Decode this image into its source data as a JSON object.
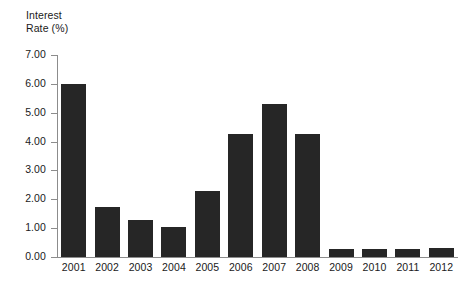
{
  "chart_data": {
    "type": "bar",
    "title": "",
    "ylabel": "Interest\nRate (%)",
    "xlabel": "",
    "categories": [
      "2001",
      "2002",
      "2003",
      "2004",
      "2005",
      "2006",
      "2007",
      "2008",
      "2009",
      "2010",
      "2011",
      "2012"
    ],
    "values": [
      6.0,
      1.75,
      1.3,
      1.05,
      2.28,
      4.25,
      5.3,
      4.25,
      0.28,
      0.28,
      0.28,
      0.3
    ],
    "ylim": [
      0.0,
      7.0
    ],
    "ytick_labels": [
      "7.00",
      "6.00",
      "5.00",
      "4.00",
      "3.00",
      "2.00",
      "1.00",
      "0.00"
    ],
    "ytick_values": [
      7.0,
      6.0,
      5.0,
      4.0,
      3.0,
      2.0,
      1.0,
      0.0
    ],
    "grid": false,
    "legend": false,
    "bar_color": "#262626",
    "axis_color": "#8c8c8c",
    "text_color": "#1a1a1a"
  }
}
